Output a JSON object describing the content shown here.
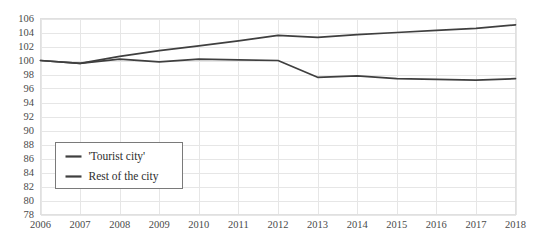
{
  "chart_data": {
    "type": "line",
    "title": "",
    "subtitle": "",
    "xlabel": "",
    "ylabel": "",
    "grid": true,
    "legend_position": "inside-bottom-left",
    "x": [
      2006,
      2007,
      2008,
      2009,
      2010,
      2011,
      2012,
      2013,
      2014,
      2015,
      2016,
      2017,
      2018
    ],
    "categories": [
      "2006",
      "2007",
      "2008",
      "2009",
      "2010",
      "2011",
      "2012",
      "2013",
      "2014",
      "2015",
      "2016",
      "2017",
      "2018"
    ],
    "xlim": [
      2006,
      2018
    ],
    "ylim": [
      78,
      106
    ],
    "yticks": [
      78,
      80,
      82,
      84,
      86,
      88,
      90,
      92,
      94,
      96,
      98,
      100,
      102,
      104,
      106
    ],
    "ytick_labels": [
      "78",
      "80",
      "82",
      "84",
      "86",
      "88",
      "90",
      "92",
      "94",
      "96",
      "98",
      "100",
      "102",
      "104",
      "106"
    ],
    "series": [
      {
        "name": "'Tourist city'",
        "color": "#3f3f3f",
        "values": [
          100.0,
          99.6,
          100.2,
          99.8,
          100.2,
          100.1,
          100.0,
          97.6,
          97.8,
          97.4,
          97.3,
          97.2,
          97.4
        ]
      },
      {
        "name": "Rest of the city",
        "color": "#3f3f3f",
        "values": [
          100.0,
          99.6,
          100.6,
          101.4,
          102.1,
          102.8,
          103.6,
          103.3,
          103.7,
          104.0,
          104.3,
          104.6,
          105.1
        ]
      }
    ]
  },
  "legend": {
    "entries": [
      {
        "label": "'Tourist city'"
      },
      {
        "label": "Rest of the city"
      }
    ]
  }
}
